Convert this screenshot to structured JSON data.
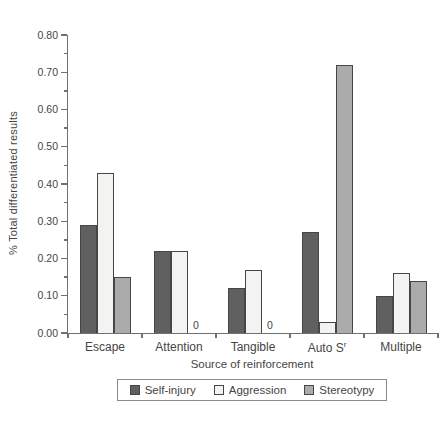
{
  "chart_data": {
    "type": "bar",
    "title": "",
    "xlabel": "Source of reinforcement",
    "ylabel": "% Total differentiated results",
    "categories": [
      {
        "label": "Escape"
      },
      {
        "label": "Attention"
      },
      {
        "label": "Tangible"
      },
      {
        "label": "Auto S",
        "sup": "r"
      },
      {
        "label": "Multiple"
      }
    ],
    "series": [
      {
        "name": "Self-injury",
        "color": "#606060",
        "values": [
          0.29,
          0.22,
          0.12,
          0.27,
          0.1
        ]
      },
      {
        "name": "Aggression",
        "color": "#f3f3f1",
        "values": [
          0.43,
          0.22,
          0.17,
          0.03,
          0.16
        ]
      },
      {
        "name": "Stereotypy",
        "color": "#ababab",
        "values": [
          0.15,
          0,
          0,
          0.72,
          0.14
        ]
      }
    ],
    "ylim": [
      0,
      0.8
    ],
    "ytick_step": 0.1,
    "yminor_step": 0.05,
    "ytick_labels": [
      "0.00",
      "0.10",
      "0.20",
      "0.30",
      "0.40",
      "0.50",
      "0.60",
      "0.70",
      "0.80"
    ],
    "zero_value_label": "0",
    "grid": false,
    "legend_position": "bottom"
  },
  "colors": {
    "text": "#454545",
    "axis": "#707070",
    "bar_border": "#464646",
    "legend_border": "#8a8a8a"
  }
}
